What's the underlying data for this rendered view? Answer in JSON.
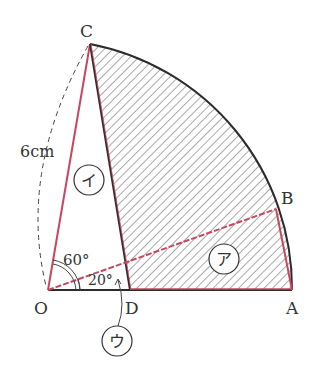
{
  "diagram": {
    "points": {
      "O": "O",
      "A": "A",
      "B": "B",
      "C": "C",
      "D": "D"
    },
    "length_label": "6cm",
    "angles": {
      "COD": "60°",
      "BOD": "20°"
    },
    "regions": {
      "a": "ア",
      "i": "イ",
      "u": "ウ"
    },
    "colors": {
      "outline": "#2b2b2b",
      "highlight": "#c8475e",
      "hatch": "#555555"
    }
  }
}
